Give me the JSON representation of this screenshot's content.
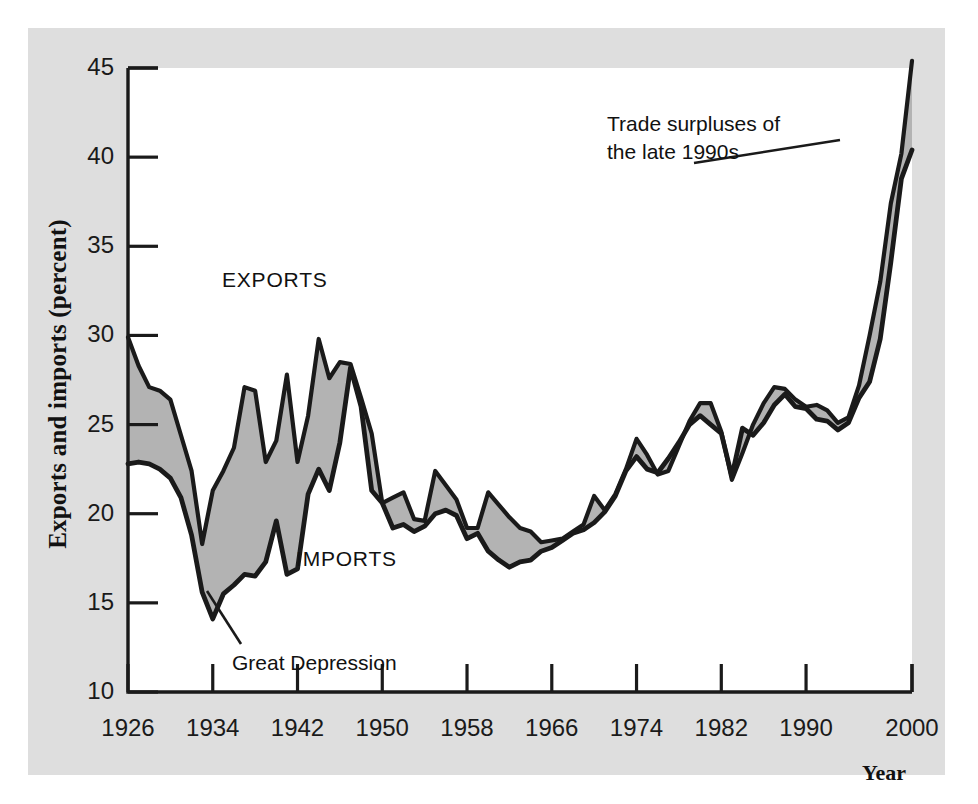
{
  "figure": {
    "background_color": "#dedede",
    "plot_background_color": "#ffffff",
    "line_color": "#1a1a1a",
    "fill_color": "#b3b3b3"
  },
  "axes": {
    "y_axis_title": "Exports and imports (percent)",
    "x_axis_title": "Year",
    "y_ticks": [
      "45",
      "40",
      "35",
      "30",
      "25",
      "20",
      "15",
      "10"
    ],
    "x_ticks": [
      "1926",
      "1934",
      "1942",
      "1950",
      "1958",
      "1966",
      "1974",
      "1982",
      "1990",
      "2000"
    ]
  },
  "labels": {
    "exports": "EXPORTS",
    "imports": "IMPORTS"
  },
  "annotations": [
    {
      "name": "trade-surpluses",
      "text": "Trade surpluses of\nthe late 1990s"
    },
    {
      "name": "great-depression",
      "text": "Great Depression"
    }
  ],
  "chart_data": {
    "type": "area",
    "title": "",
    "subtitle": "",
    "xlabel": "Year",
    "ylabel": "Exports and imports (percent)",
    "xlim": [
      1926,
      2000
    ],
    "ylim": [
      10,
      45
    ],
    "grid": false,
    "legend_position": "inline-annotations",
    "annotations": [
      {
        "text": "Trade surpluses of the late 1990s",
        "x": 1984,
        "y": 41.5
      },
      {
        "text": "Great Depression",
        "x": 1936,
        "y": 11.8
      },
      {
        "text": "EXPORTS",
        "x": 1936,
        "y": 32.5
      },
      {
        "text": "IMPORTS",
        "x": 1947,
        "y": 17.6
      }
    ],
    "x": [
      1926,
      1927,
      1928,
      1929,
      1930,
      1931,
      1932,
      1933,
      1934,
      1935,
      1936,
      1937,
      1938,
      1939,
      1940,
      1941,
      1942,
      1943,
      1944,
      1945,
      1946,
      1947,
      1948,
      1949,
      1950,
      1951,
      1952,
      1953,
      1954,
      1955,
      1956,
      1957,
      1958,
      1959,
      1960,
      1961,
      1962,
      1963,
      1964,
      1965,
      1966,
      1967,
      1968,
      1969,
      1970,
      1971,
      1972,
      1973,
      1974,
      1975,
      1976,
      1977,
      1978,
      1979,
      1980,
      1981,
      1982,
      1983,
      1984,
      1985,
      1986,
      1987,
      1988,
      1989,
      1990,
      1991,
      1992,
      1993,
      1994,
      1995,
      1996,
      1997,
      1998,
      1999,
      2000
    ],
    "series": [
      {
        "name": "EXPORTS",
        "values": [
          29.9,
          28.3,
          27.1,
          26.9,
          26.4,
          24.4,
          22.4,
          18.3,
          21.3,
          22.4,
          23.7,
          27.1,
          26.9,
          22.9,
          24.1,
          27.8,
          22.9,
          25.5,
          29.8,
          27.6,
          28.5,
          28.4,
          26.5,
          24.5,
          20.6,
          20.9,
          21.2,
          19.7,
          19.6,
          22.4,
          21.6,
          20.8,
          19.2,
          19.2,
          21.2,
          20.5,
          19.8,
          19.2,
          19.0,
          18.4,
          18.5,
          18.6,
          19.0,
          19.4,
          21.0,
          20.2,
          21.1,
          22.5,
          24.2,
          23.3,
          22.2,
          22.4,
          23.8,
          25.2,
          26.2,
          26.2,
          24.6,
          21.9,
          23.4,
          25.0,
          26.2,
          27.1,
          27.0,
          26.4,
          26.0,
          26.1,
          25.8,
          25.1,
          25.4,
          27.2,
          30.0,
          33.0,
          37.4,
          40.2,
          45.4
        ]
      },
      {
        "name": "IMPORTS",
        "values": [
          22.8,
          22.9,
          22.8,
          22.5,
          22.0,
          20.9,
          18.8,
          15.6,
          14.1,
          15.5,
          16.0,
          16.6,
          16.5,
          17.3,
          19.6,
          16.6,
          16.9,
          21.1,
          22.5,
          21.3,
          24.0,
          28.2,
          26.0,
          21.3,
          20.6,
          19.2,
          19.4,
          19.0,
          19.3,
          20.0,
          20.2,
          19.9,
          18.6,
          18.9,
          17.9,
          17.4,
          17.0,
          17.3,
          17.4,
          17.9,
          18.1,
          18.5,
          18.9,
          19.1,
          19.5,
          20.1,
          21.0,
          22.4,
          23.2,
          22.5,
          22.3,
          23.1,
          24.0,
          25.0,
          25.5,
          25.0,
          24.5,
          22.1,
          24.8,
          24.4,
          25.1,
          26.1,
          26.7,
          26.0,
          25.9,
          25.3,
          25.2,
          24.7,
          25.1,
          26.5,
          27.4,
          29.8,
          34.1,
          38.8,
          40.4
        ]
      }
    ]
  }
}
